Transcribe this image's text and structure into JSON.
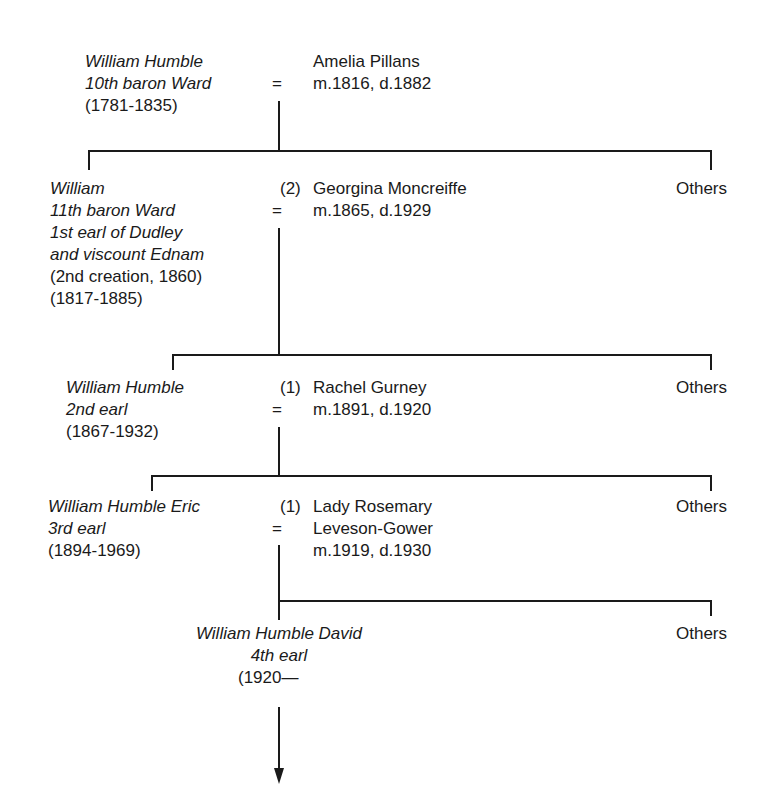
{
  "diagram": {
    "type": "family-tree",
    "generations": [
      {
        "person": {
          "name": "William Humble",
          "title": "10th baron Ward",
          "dates": "(1781-1835)"
        },
        "spouse": {
          "marriage_no": "",
          "name": "Amelia Pillans",
          "detail": "m.1816, d.1882"
        },
        "marriage_symbol": "="
      },
      {
        "person": {
          "name": "William",
          "title_lines": [
            "11th baron Ward",
            "1st earl of Dudley",
            "and viscount Ednam"
          ],
          "note": "(2nd creation, 1860)",
          "dates": "(1817-1885)"
        },
        "spouse": {
          "marriage_no": "(2)",
          "name": "Georgina Moncreiffe",
          "detail": "m.1865, d.1929"
        },
        "siblings_label": "Others",
        "marriage_symbol": "="
      },
      {
        "person": {
          "name": "William Humble",
          "title": "2nd earl",
          "dates": "(1867-1932)"
        },
        "spouse": {
          "marriage_no": "(1)",
          "name": "Rachel Gurney",
          "detail": "m.1891, d.1920"
        },
        "siblings_label": "Others",
        "marriage_symbol": "="
      },
      {
        "person": {
          "name": "William Humble Eric",
          "title": "3rd earl",
          "dates": "(1894-1969)"
        },
        "spouse": {
          "marriage_no": "(1)",
          "name_lines": [
            "Lady Rosemary",
            "Leveson-Gower"
          ],
          "detail": "m.1919, d.1930"
        },
        "siblings_label": "Others",
        "marriage_symbol": "="
      },
      {
        "person": {
          "name": "William Humble David",
          "title": "4th earl",
          "dates": "(1920—"
        },
        "siblings_label": "Others",
        "continues": "arrow-down"
      }
    ]
  }
}
